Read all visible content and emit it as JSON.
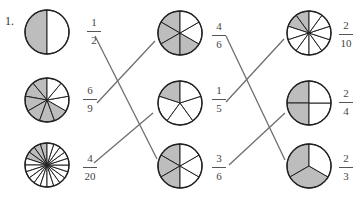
{
  "problem_number": "1.",
  "colors": {
    "shade": "#bdbdbd",
    "stroke": "#222222",
    "line": "#6e6e6e",
    "fill": "#ffffff"
  },
  "columns": [
    {
      "items": [
        {
          "id": "c1r1",
          "numerator": "1",
          "denominator": "2",
          "slices": 2,
          "shaded": [
            0
          ],
          "cx": 47,
          "cy": 32,
          "r": 22,
          "fx": 86,
          "fy": 17
        },
        {
          "id": "c1r2",
          "numerator": "6",
          "denominator": "9",
          "slices": 9,
          "shaded": [
            0,
            1,
            2,
            3,
            4,
            5
          ],
          "cx": 47,
          "cy": 100,
          "r": 22,
          "fx": 82,
          "fy": 85
        },
        {
          "id": "c1r3",
          "numerator": "4",
          "denominator": "20",
          "slices": 20,
          "shaded": [
            0,
            1,
            2,
            3
          ],
          "cx": 47,
          "cy": 165,
          "r": 22,
          "fx": 82,
          "fy": 153
        }
      ]
    },
    {
      "items": [
        {
          "id": "c2r1",
          "numerator": "4",
          "denominator": "6",
          "slices": 6,
          "shaded": [
            0,
            1,
            2,
            3
          ],
          "cx": 180,
          "cy": 33,
          "r": 22,
          "fx": 211,
          "fy": 21
        },
        {
          "id": "c2r2",
          "numerator": "1",
          "denominator": "5",
          "slices": 5,
          "shaded": [
            0
          ],
          "cx": 180,
          "cy": 103,
          "r": 22,
          "fx": 211,
          "fy": 85
        },
        {
          "id": "c2r3",
          "numerator": "3",
          "denominator": "6",
          "slices": 6,
          "shaded": [
            0,
            1,
            2
          ],
          "cx": 180,
          "cy": 166,
          "r": 22,
          "fx": 211,
          "fy": 153
        }
      ]
    },
    {
      "items": [
        {
          "id": "c3r1",
          "numerator": "2",
          "denominator": "10",
          "slices": 10,
          "shaded": [
            0,
            1
          ],
          "cx": 309,
          "cy": 33,
          "r": 22,
          "fx": 338,
          "fy": 20
        },
        {
          "id": "c3r2",
          "numerator": "2",
          "denominator": "4",
          "slices": 4,
          "shaded": [
            0,
            1
          ],
          "cx": 309,
          "cy": 103,
          "r": 22,
          "fx": 338,
          "fy": 88
        },
        {
          "id": "c3r3",
          "numerator": "2",
          "denominator": "3",
          "slices": 3,
          "shaded": [
            0,
            1
          ],
          "cx": 309,
          "cy": 166,
          "r": 22,
          "fx": 338,
          "fy": 153
        }
      ]
    }
  ],
  "matches": [
    {
      "from": "1/2",
      "to": "3/6",
      "x1": 95,
      "y1": 36,
      "x2": 157,
      "y2": 159
    },
    {
      "from": "6/9",
      "to": "4/6",
      "x1": 97,
      "y1": 103,
      "x2": 155,
      "y2": 41
    },
    {
      "from": "4/20",
      "to": "1/5",
      "x1": 94,
      "y1": 163,
      "x2": 153,
      "y2": 113
    },
    {
      "from": "4/6",
      "to": "2/3",
      "x1": 226,
      "y1": 36,
      "x2": 285,
      "y2": 160
    },
    {
      "from": "1/5",
      "to": "2/10",
      "x1": 226,
      "y1": 102,
      "x2": 284,
      "y2": 39
    },
    {
      "from": "3/6",
      "to": "2/4",
      "x1": 229,
      "y1": 165,
      "x2": 285,
      "y2": 113
    }
  ]
}
